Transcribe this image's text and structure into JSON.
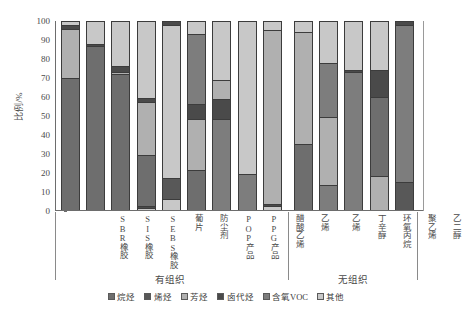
{
  "chart_data": {
    "type": "bar",
    "subtype": "stacked-percentage-column",
    "title": "",
    "xlabel": "",
    "ylabel": "比例/%",
    "ylim": [
      0,
      100
    ],
    "yticks": [
      0,
      10,
      20,
      30,
      40,
      50,
      60,
      70,
      80,
      90,
      100
    ],
    "grid": false,
    "legend_position": "bottom-center",
    "categories": [
      "SBR橡胶",
      "SIS橡胶",
      "SEBS橡胶",
      "葡片",
      "防尘剂",
      "POP产品",
      "PPG产品",
      "醋酸乙烯",
      "乙烯",
      "乙烯",
      "丁辛醇",
      "环氧丙烷",
      "聚乙烯",
      "乙二醇"
    ],
    "groups": [
      {
        "label": "有组织",
        "start_index": 0,
        "end_index": 8
      },
      {
        "label": "无组织",
        "start_index": 9,
        "end_index": 13
      }
    ],
    "series": [
      {
        "name": "烷烃",
        "color": "#6e6e6e",
        "values": [
          70,
          87,
          72,
          27,
          0,
          21,
          0,
          0,
          0,
          35,
          0,
          0,
          60,
          0
        ]
      },
      {
        "name": "烯烃",
        "color": "#585858",
        "values": [
          0,
          0,
          0,
          0,
          11,
          0,
          0,
          0,
          0,
          0,
          0,
          0,
          0,
          15
        ]
      },
      {
        "name": "芳烃",
        "color": "#b0b0b0",
        "values": [
          26,
          0,
          1,
          28,
          5,
          27,
          48,
          19,
          92,
          59,
          36,
          20,
          0,
          0
        ]
      },
      {
        "name": "卤代烃",
        "color": "#4a4a4a",
        "values": [
          2,
          1,
          3,
          1,
          0,
          0,
          11,
          0,
          1,
          0,
          0,
          0,
          0,
          0
        ]
      },
      {
        "name": "含氧VOC",
        "color": "#7d7d7d",
        "values": [
          0,
          0,
          0,
          0,
          0,
          0,
          0,
          0,
          0,
          0,
          41,
          73,
          33,
          83
        ]
      },
      {
        "name": "其他",
        "color": "#c8c8c8",
        "values": [
          2,
          12,
          24,
          44,
          84,
          52,
          41,
          81,
          7,
          6,
          23,
          7,
          7,
          2
        ]
      }
    ],
    "stack_order": [
      "烷烃",
      "烯烃",
      "芳烃",
      "卤代烃",
      "含氧VOC",
      "其他"
    ],
    "bars": [
      {
        "category": "SBR橡胶",
        "segments": [
          {
            "name": "烷烃",
            "value": 70,
            "color": "#6e6e6e"
          },
          {
            "name": "芳烃",
            "value": 26,
            "color": "#b0b0b0"
          },
          {
            "name": "卤代烃",
            "value": 2,
            "color": "#4a4a4a"
          },
          {
            "name": "其他",
            "value": 2,
            "color": "#c8c8c8"
          }
        ]
      },
      {
        "category": "SIS橡胶",
        "segments": [
          {
            "name": "烷烃",
            "value": 87,
            "color": "#6e6e6e"
          },
          {
            "name": "卤代烃",
            "value": 1,
            "color": "#4a4a4a"
          },
          {
            "name": "其他",
            "value": 12,
            "color": "#c8c8c8"
          }
        ]
      },
      {
        "category": "SEBS橡胶",
        "segments": [
          {
            "name": "烷烃",
            "value": 72,
            "color": "#6e6e6e"
          },
          {
            "name": "芳烃",
            "value": 1,
            "color": "#b0b0b0"
          },
          {
            "name": "卤代烃",
            "value": 3,
            "color": "#4a4a4a"
          },
          {
            "name": "其他",
            "value": 24,
            "color": "#c8c8c8"
          }
        ]
      },
      {
        "category": "葡片",
        "segments": [
          {
            "name": "其他",
            "value": 1,
            "color": "#c8c8c8"
          },
          {
            "name": "卤代烃",
            "value": 1,
            "color": "#4a4a4a"
          },
          {
            "name": "烷烃",
            "value": 27,
            "color": "#6e6e6e"
          },
          {
            "name": "芳烃",
            "value": 28,
            "color": "#b0b0b0"
          },
          {
            "name": "卤代烃2",
            "value": 2,
            "color": "#4a4a4a"
          },
          {
            "name": "其他2",
            "value": 41,
            "color": "#c8c8c8"
          }
        ]
      },
      {
        "category": "防尘剂",
        "segments": [
          {
            "name": "其他",
            "value": 6,
            "color": "#c8c8c8"
          },
          {
            "name": "烯烃",
            "value": 11,
            "color": "#585858"
          },
          {
            "name": "其他2",
            "value": 81,
            "color": "#c8c8c8"
          },
          {
            "name": "卤代烃",
            "value": 2,
            "color": "#4a4a4a"
          }
        ]
      },
      {
        "category": "POP产品",
        "segments": [
          {
            "name": "烷烃",
            "value": 21,
            "color": "#6e6e6e"
          },
          {
            "name": "芳烃",
            "value": 27,
            "color": "#b0b0b0"
          },
          {
            "name": "卤代烃",
            "value": 8,
            "color": "#4a4a4a"
          },
          {
            "name": "含氧VOC",
            "value": 37,
            "color": "#7d7d7d"
          },
          {
            "name": "其他",
            "value": 7,
            "color": "#c8c8c8"
          }
        ]
      },
      {
        "category": "PPG产品",
        "segments": [
          {
            "name": "含氧VOC",
            "value": 48,
            "color": "#7d7d7d"
          },
          {
            "name": "卤代烃",
            "value": 11,
            "color": "#4a4a4a"
          },
          {
            "name": "芳烃",
            "value": 10,
            "color": "#b0b0b0"
          },
          {
            "name": "其他",
            "value": 31,
            "color": "#c8c8c8"
          }
        ]
      },
      {
        "category": "醋酸乙烯",
        "segments": [
          {
            "name": "含氧VOC",
            "value": 19,
            "color": "#7d7d7d"
          },
          {
            "name": "其他",
            "value": 81,
            "color": "#c8c8c8"
          }
        ]
      },
      {
        "category": "乙烯",
        "segments": [
          {
            "name": "其他",
            "value": 2,
            "color": "#c8c8c8"
          },
          {
            "name": "卤代烃",
            "value": 1,
            "color": "#4a4a4a"
          },
          {
            "name": "芳烃",
            "value": 92,
            "color": "#b0b0b0"
          },
          {
            "name": "其他2",
            "value": 5,
            "color": "#c8c8c8"
          }
        ]
      },
      {
        "category": "乙烯",
        "segments": [
          {
            "name": "烷烃",
            "value": 35,
            "color": "#6e6e6e"
          },
          {
            "name": "芳烃",
            "value": 59,
            "color": "#b0b0b0"
          },
          {
            "name": "其他",
            "value": 6,
            "color": "#c8c8c8"
          }
        ]
      },
      {
        "category": "丁辛醇",
        "segments": [
          {
            "name": "含氧VOC",
            "value": 13,
            "color": "#7d7d7d"
          },
          {
            "name": "芳烃",
            "value": 36,
            "color": "#b0b0b0"
          },
          {
            "name": "含氧VOC2",
            "value": 29,
            "color": "#7d7d7d"
          },
          {
            "name": "其他",
            "value": 22,
            "color": "#c8c8c8"
          }
        ]
      },
      {
        "category": "环氧丙烷",
        "segments": [
          {
            "name": "含氧VOC",
            "value": 73,
            "color": "#7d7d7d"
          },
          {
            "name": "卤代烃",
            "value": 1,
            "color": "#4a4a4a"
          },
          {
            "name": "其他",
            "value": 26,
            "color": "#c8c8c8"
          }
        ]
      },
      {
        "category": "聚乙烯",
        "segments": [
          {
            "name": "芳烃",
            "value": 18,
            "color": "#b0b0b0"
          },
          {
            "name": "烷烃",
            "value": 42,
            "color": "#6e6e6e"
          },
          {
            "name": "卤代烃",
            "value": 14,
            "color": "#4a4a4a"
          },
          {
            "name": "其他",
            "value": 26,
            "color": "#c8c8c8"
          }
        ]
      },
      {
        "category": "乙二醇",
        "segments": [
          {
            "name": "烯烃",
            "value": 15,
            "color": "#585858"
          },
          {
            "name": "含氧VOC",
            "value": 83,
            "color": "#7d7d7d"
          },
          {
            "name": "卤代烃",
            "value": 2,
            "color": "#4a4a4a"
          }
        ]
      }
    ],
    "legend": [
      {
        "label": "烷烃",
        "color": "#6e6e6e"
      },
      {
        "label": "烯烃",
        "color": "#585858"
      },
      {
        "label": "芳烃",
        "color": "#b0b0b0"
      },
      {
        "label": "卤代烃",
        "color": "#4a4a4a"
      },
      {
        "label": "含氧VOC",
        "color": "#7d7d7d"
      },
      {
        "label": "其他",
        "color": "#c8c8c8"
      }
    ]
  }
}
